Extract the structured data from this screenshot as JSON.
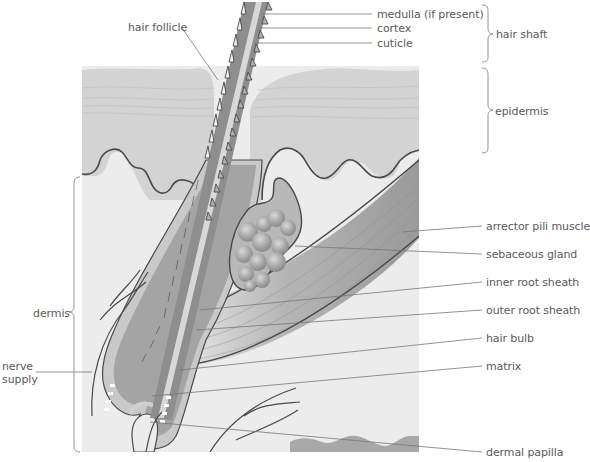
{
  "colors": {
    "background": "#ffffff",
    "dermis": "#ececec",
    "epidermis": "#d3d3d3",
    "epidermis_line": "#c2c2c2",
    "outline": "#4a4a4a",
    "hair_shaft": "#8e8e8e",
    "medulla": "#d8d8d8",
    "sheath": "#b8b8b8",
    "muscle": "#9a9a9a",
    "gland": "#a9a9a9",
    "leader_line": "#777777",
    "label_text": "#5a5a5a"
  },
  "labels": {
    "hair_follicle": "hair follicle",
    "medulla": "medulla (if present)",
    "cortex": "cortex",
    "cuticle": "cuticle",
    "hair_shaft": "hair shaft",
    "epidermis": "epidermis",
    "dermis": "dermis",
    "nerve_supply_1": "nerve",
    "nerve_supply_2": "supply",
    "arrector_pili_muscle": "arrector pili muscle",
    "sebaceous_gland": "sebaceous gland",
    "inner_root_sheath": "inner root sheath",
    "outer_root_sheath": "outer root sheath",
    "hair_bulb": "hair bulb",
    "matrix": "matrix",
    "dermal_papilla": "dermal papilla"
  },
  "brackets": [
    {
      "name": "hair shaft",
      "side": "right",
      "y_range": [
        5,
        62
      ]
    },
    {
      "name": "epidermis",
      "side": "right",
      "y_range": [
        68,
        153
      ]
    },
    {
      "name": "dermis",
      "side": "left",
      "y_range": [
        177,
        452
      ]
    }
  ]
}
